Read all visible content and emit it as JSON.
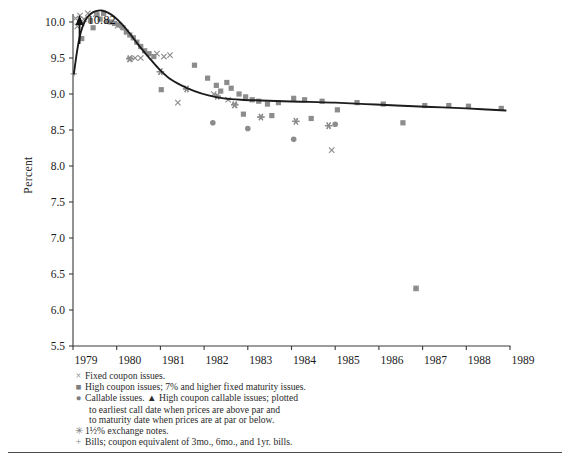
{
  "figure": {
    "y_axis_title": "Percent",
    "peak_annotation": "10.82",
    "peak_annotation_icon": "up-arrow-icon"
  },
  "legend": {
    "items": [
      {
        "marker": "×",
        "marker_name": "cross-marker-icon",
        "text": "Fixed coupon issues."
      },
      {
        "marker": "■",
        "marker_name": "square-marker-icon",
        "text": "High coupon issues; 7% and higher fixed maturity issues."
      },
      {
        "marker": "●",
        "marker_name": "circle-marker-icon",
        "text": "Callable issues. ▲ High coupon callable issues; plotted",
        "continuation": [
          "to earliest call date when prices are above par and",
          "to maturity date when prices are at par or below."
        ]
      },
      {
        "marker": "✳",
        "marker_name": "asterisk-marker-icon",
        "text": "1½% exchange notes."
      },
      {
        "marker": "+",
        "marker_name": "plus-marker-icon",
        "text": "Bills; coupon equivalent of 3mo., 6mo., and 1yr. bills."
      }
    ]
  },
  "chart_data": {
    "type": "scatter",
    "title": "",
    "xlabel": "",
    "ylabel": "Percent",
    "xlim": [
      1979,
      1989
    ],
    "ylim": [
      5.5,
      10.3
    ],
    "yticks": [
      5.5,
      6.0,
      6.5,
      7.0,
      7.5,
      8.0,
      8.5,
      9.0,
      9.5,
      10.0
    ],
    "ytick_labels": [
      "5.5",
      "6.0",
      "6.5",
      "7.0",
      "7.5",
      "8.0",
      "8.5",
      "9.0",
      "9.5",
      "10.0"
    ],
    "xticks": [
      1979,
      1980,
      1981,
      1982,
      1983,
      1984,
      1985,
      1986,
      1987,
      1988,
      1989
    ],
    "xtick_labels": [
      "1979",
      "1980",
      "1981",
      "1982",
      "1983",
      "1984",
      "1985",
      "1986",
      "1987",
      "1988",
      "1989"
    ],
    "grid": false,
    "legend_position": "below-plot",
    "colors": {
      "curve": "#1c1c1c",
      "markers": "#8c8c8c",
      "axis": "#3a3a3a"
    },
    "annotations": [
      {
        "label": "10.82",
        "x": 1979.15,
        "y": 10.3,
        "type": "off-scale-arrow",
        "note": "Value above top of scale, marked with upward arrow."
      }
    ],
    "series": [
      {
        "name": "Fitted yield curve",
        "type": "line",
        "points": [
          [
            1979.02,
            9.28
          ],
          [
            1979.1,
            9.62
          ],
          [
            1979.18,
            9.86
          ],
          [
            1979.28,
            10.02
          ],
          [
            1979.4,
            10.11
          ],
          [
            1979.52,
            10.15
          ],
          [
            1979.66,
            10.16
          ],
          [
            1979.8,
            10.13
          ],
          [
            1979.95,
            10.07
          ],
          [
            1980.12,
            9.97
          ],
          [
            1980.3,
            9.84
          ],
          [
            1980.5,
            9.68
          ],
          [
            1980.72,
            9.52
          ],
          [
            1980.95,
            9.36
          ],
          [
            1981.2,
            9.22
          ],
          [
            1981.48,
            9.12
          ],
          [
            1981.78,
            9.04
          ],
          [
            1982.1,
            8.98
          ],
          [
            1982.45,
            8.94
          ],
          [
            1982.85,
            8.92
          ],
          [
            1983.3,
            8.91
          ],
          [
            1983.8,
            8.9
          ],
          [
            1984.4,
            8.89
          ],
          [
            1985.0,
            8.88
          ],
          [
            1985.7,
            8.86
          ],
          [
            1986.4,
            8.84
          ],
          [
            1987.2,
            8.82
          ],
          [
            1988.0,
            8.8
          ],
          [
            1988.9,
            8.77
          ]
        ]
      },
      {
        "name": "Fixed coupon issues",
        "marker": "cross",
        "points": [
          [
            1979.06,
            10.05
          ],
          [
            1979.1,
            9.94
          ],
          [
            1979.16,
            10.09
          ],
          [
            1979.2,
            9.98
          ],
          [
            1979.25,
            10.04
          ],
          [
            1979.34,
            10.12
          ],
          [
            1979.52,
            10.11
          ],
          [
            1979.62,
            10.16
          ],
          [
            1979.78,
            10.14
          ],
          [
            1980.02,
            9.95
          ],
          [
            1980.3,
            9.48
          ],
          [
            1980.42,
            9.5
          ],
          [
            1980.55,
            9.5
          ],
          [
            1980.92,
            9.56
          ],
          [
            1981.08,
            9.52
          ],
          [
            1981.22,
            9.54
          ],
          [
            1981.4,
            8.88
          ],
          [
            1982.22,
            9.0
          ],
          [
            1982.55,
            8.92
          ],
          [
            1982.7,
            8.84
          ],
          [
            1984.92,
            8.22
          ],
          [
            1986.85,
            6.3
          ]
        ]
      },
      {
        "name": "High coupon issues",
        "marker": "square",
        "points": [
          [
            1979.2,
            9.77
          ],
          [
            1979.4,
            10.02
          ],
          [
            1979.46,
            9.92
          ],
          [
            1979.55,
            10.1
          ],
          [
            1979.62,
            10.04
          ],
          [
            1979.7,
            10.12
          ],
          [
            1979.78,
            10.01
          ],
          [
            1979.86,
            10.0
          ],
          [
            1979.95,
            9.98
          ],
          [
            1980.05,
            9.96
          ],
          [
            1980.14,
            9.92
          ],
          [
            1980.22,
            9.86
          ],
          [
            1980.3,
            9.82
          ],
          [
            1980.38,
            9.78
          ],
          [
            1980.46,
            9.72
          ],
          [
            1980.55,
            9.66
          ],
          [
            1980.64,
            9.6
          ],
          [
            1980.74,
            9.56
          ],
          [
            1980.85,
            9.52
          ],
          [
            1981.02,
            9.06
          ],
          [
            1981.78,
            9.4
          ],
          [
            1982.08,
            9.22
          ],
          [
            1982.28,
            9.12
          ],
          [
            1982.38,
            9.04
          ],
          [
            1982.52,
            9.16
          ],
          [
            1982.62,
            9.08
          ],
          [
            1982.8,
            9.0
          ],
          [
            1982.95,
            8.96
          ],
          [
            1983.1,
            8.92
          ],
          [
            1983.25,
            8.9
          ],
          [
            1983.45,
            8.86
          ],
          [
            1983.7,
            8.88
          ],
          [
            1984.05,
            8.94
          ],
          [
            1984.3,
            8.92
          ],
          [
            1984.7,
            8.9
          ],
          [
            1985.05,
            8.78
          ],
          [
            1985.5,
            8.88
          ],
          [
            1986.1,
            8.86
          ],
          [
            1987.05,
            8.84
          ],
          [
            1987.6,
            8.84
          ],
          [
            1988.05,
            8.83
          ],
          [
            1988.8,
            8.8
          ],
          [
            1982.9,
            8.72
          ],
          [
            1983.55,
            8.7
          ],
          [
            1984.45,
            8.66
          ],
          [
            1986.55,
            8.6
          ]
        ]
      },
      {
        "name": "Callable issues",
        "marker": "circle",
        "points": [
          [
            1982.2,
            8.6
          ],
          [
            1983.0,
            8.52
          ],
          [
            1984.05,
            8.37
          ],
          [
            1985.0,
            8.58
          ],
          [
            1986.85,
            6.3
          ]
        ]
      },
      {
        "name": "1½% exchange notes",
        "marker": "asterisk",
        "points": [
          [
            1980.3,
            9.49
          ],
          [
            1981.0,
            9.31
          ],
          [
            1981.6,
            9.07
          ],
          [
            1982.3,
            8.97
          ],
          [
            1982.7,
            8.85
          ],
          [
            1983.3,
            8.68
          ],
          [
            1984.1,
            8.62
          ],
          [
            1984.85,
            8.56
          ]
        ]
      },
      {
        "name": "Bills (coupon equivalent)",
        "marker": "plus",
        "points": [
          [
            1979.02,
            9.28
          ],
          [
            1979.08,
            10.3
          ]
        ]
      }
    ]
  }
}
